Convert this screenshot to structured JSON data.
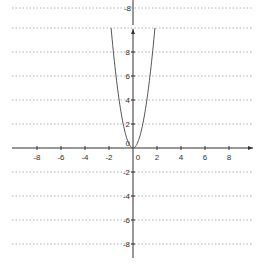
{
  "chart_data": {
    "type": "line",
    "title": "",
    "xlabel": "",
    "ylabel": "",
    "function": "y = 3x^2",
    "xlim": [
      -10,
      10
    ],
    "ylim": [
      -9,
      10
    ],
    "grid": "horizontal-dotted",
    "x_ticks": [
      -8,
      -6,
      -4,
      -2,
      0,
      2,
      4,
      6,
      8
    ],
    "y_ticks": [
      -8,
      -6,
      -4,
      -2,
      0,
      2,
      4,
      6,
      8
    ],
    "series": [
      {
        "name": "parabola",
        "x": [
          -1.8,
          -1.5,
          -1.0,
          -0.5,
          0,
          0.5,
          1.0,
          1.5,
          1.8
        ],
        "values": [
          9.72,
          6.75,
          3,
          0.75,
          0,
          0.75,
          3,
          6.75,
          9.72
        ]
      }
    ],
    "clipped_top_label": "-8"
  },
  "labels": {
    "x_ticks": [
      "-8",
      "-6",
      "-4",
      "-2",
      "0",
      "2",
      "4",
      "6",
      "8"
    ],
    "y_ticks_pos": [
      "8",
      "6",
      "4",
      "2"
    ],
    "y_ticks_neg": [
      "-2",
      "-4",
      "-6",
      "-8"
    ],
    "origin_y": "0",
    "top_fragment": "-8"
  },
  "colors": {
    "axis": "#333333",
    "grid": "#b0b0b0",
    "curve": "#555555"
  }
}
